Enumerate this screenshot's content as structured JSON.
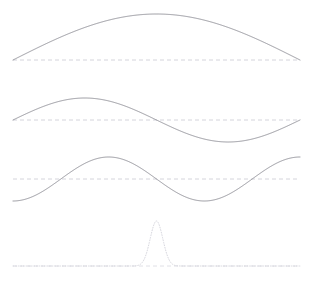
{
  "figure": {
    "background_color": "#ffffff",
    "width": 309,
    "height": 284,
    "title": "",
    "panel_count": 4
  },
  "chart_data": {
    "type": "line",
    "title": "",
    "subtitle": "",
    "xlabel": "",
    "ylabel": "",
    "grid": false,
    "legend": "none",
    "x_domain": [
      0,
      1
    ],
    "x_pixel_range": [
      13,
      300
    ],
    "panels": [
      {
        "index": 1,
        "name": "fundamental-half-sine",
        "curve_type": "half-sine",
        "function": "A*sin(pi*x)",
        "periods": 0.5,
        "nodes": 2,
        "antinodes": 1,
        "amplitude_px": 46,
        "baseline_y_px": 60,
        "peak_y_px": 14,
        "stroke_color": "#8a8a92",
        "stroke_width": 0.9,
        "stroke_style": "solid",
        "baseline_color": "#c9c9d2",
        "baseline_style": "dashed",
        "sample_points_x": [
          0,
          0.125,
          0.25,
          0.375,
          0.5,
          0.625,
          0.75,
          0.875,
          1
        ],
        "sample_points_y": [
          0,
          0.383,
          0.707,
          0.924,
          1.0,
          0.924,
          0.707,
          0.383,
          0
        ]
      },
      {
        "index": 2,
        "name": "second-harmonic-full-sine",
        "curve_type": "full-sine",
        "function": "A*sin(2*pi*x)",
        "periods": 1.0,
        "nodes": 3,
        "antinodes": 2,
        "amplitude_px": 22,
        "baseline_y_px": 120,
        "peak_y_px": 98,
        "trough_y_px": 142,
        "stroke_color": "#8a8a92",
        "stroke_width": 0.9,
        "stroke_style": "solid",
        "baseline_color": "#c9c9d2",
        "baseline_style": "dashed",
        "sample_points_x": [
          0,
          0.125,
          0.25,
          0.375,
          0.5,
          0.625,
          0.75,
          0.875,
          1
        ],
        "sample_points_y": [
          0,
          0.707,
          1.0,
          0.707,
          0,
          -0.707,
          -1.0,
          -0.707,
          0
        ]
      },
      {
        "index": 3,
        "name": "third-harmonic-cosine-lobes",
        "curve_type": "inverted-cosine-three-lobe",
        "function": "-A*cos(3*pi*x)",
        "periods": 1.5,
        "nodes": 4,
        "antinodes": 3,
        "amplitude_px": 22,
        "baseline_y_px": 179,
        "peak_y_px": 157,
        "trough_y_px": 202,
        "stroke_color": "#8a8a92",
        "stroke_width": 0.9,
        "stroke_style": "solid",
        "baseline_color": "#c9c9d2",
        "baseline_style": "dashed",
        "sample_points_x": [
          0,
          0.1667,
          0.3333,
          0.5,
          0.6667,
          0.8333,
          1
        ],
        "sample_points_y": [
          0,
          -1.0,
          0,
          1.0,
          0,
          -1.0,
          0
        ]
      },
      {
        "index": 4,
        "name": "localized-wave-packet",
        "curve_type": "gaussian-peak",
        "function": "A*exp(-((x-0.5)^2)/(2*s^2))",
        "center_x_norm": 0.5,
        "center_x_px": 157,
        "sigma_norm": 0.022,
        "amplitude_px": 45,
        "baseline_y_px": 266,
        "peak_y_px": 221,
        "stroke_color": "#d2d2da",
        "stroke_width": 0.9,
        "stroke_style": "dotted",
        "baseline_color": "#d8d8e0",
        "baseline_style": "dashed",
        "sample_points_x": [
          0.4,
          0.44,
          0.47,
          0.5,
          0.53,
          0.56,
          0.6
        ],
        "sample_points_y": [
          0.01,
          0.13,
          0.62,
          1.0,
          0.62,
          0.13,
          0.01
        ]
      }
    ]
  }
}
